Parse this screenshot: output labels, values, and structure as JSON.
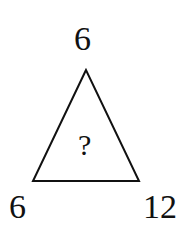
{
  "puzzle": {
    "top_value": "6",
    "bottom_left_value": "6",
    "bottom_right_value": "12",
    "center_value": "?"
  },
  "colors": {
    "stroke": "#111111",
    "background": "#ffffff"
  }
}
